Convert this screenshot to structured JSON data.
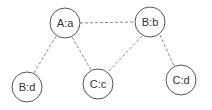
{
  "diagram": {
    "type": "graph",
    "nodes": [
      {
        "id": "Aa",
        "label": "A:a",
        "cx": 65,
        "cy": 23,
        "r": 15
      },
      {
        "id": "Bb",
        "label": "B:b",
        "cx": 150,
        "cy": 23,
        "r": 15
      },
      {
        "id": "Bd",
        "label": "B:d",
        "cx": 27,
        "cy": 87,
        "r": 15
      },
      {
        "id": "Cc",
        "label": "C:c",
        "cx": 98,
        "cy": 83,
        "r": 15
      },
      {
        "id": "Cd",
        "label": "C:d",
        "cx": 181,
        "cy": 79,
        "r": 15
      }
    ],
    "edges": [
      {
        "from": "Aa",
        "to": "Bb",
        "style": "dashed"
      },
      {
        "from": "Aa",
        "to": "Bd",
        "style": "dashed"
      },
      {
        "from": "Aa",
        "to": "Cc",
        "style": "dashed"
      },
      {
        "from": "Bb",
        "to": "Cc",
        "style": "dashed"
      },
      {
        "from": "Bb",
        "to": "Cd",
        "style": "dashed"
      }
    ]
  }
}
